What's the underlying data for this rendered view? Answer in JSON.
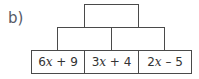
{
  "label": "b)",
  "pyramid": {
    "top": [
      {
        "value": ""
      }
    ],
    "middle": [
      {
        "value": ""
      },
      {
        "value": ""
      }
    ],
    "bottom": [
      {
        "coef": "6",
        "var": "x",
        "rest": " + 9"
      },
      {
        "coef": "3",
        "var": "x",
        "rest": " + 4"
      },
      {
        "coef": "2",
        "var": "x",
        "rest": " – 5"
      }
    ]
  }
}
